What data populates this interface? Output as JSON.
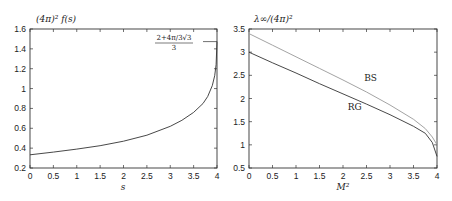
{
  "chart_data": [
    {
      "type": "line",
      "title": "",
      "ylabel": "(4π)² f(s)",
      "xlabel": "s",
      "xlim": [
        0,
        4
      ],
      "ylim": [
        0.2,
        1.6
      ],
      "xticks": [
        "0",
        "0.5",
        "1",
        "1.5",
        "2",
        "2.5",
        "3",
        "3.5",
        "4"
      ],
      "yticks": [
        "0.2",
        "0.4",
        "0.6",
        "0.8",
        "1",
        "1.2",
        "1.4",
        "1.6"
      ],
      "grid": false,
      "annotation": {
        "numerator": "2+4π/3√3",
        "denominator": "3",
        "y": 1.473
      },
      "series": [
        {
          "name": "f(s)",
          "x": [
            0,
            0.5,
            1,
            1.5,
            2,
            2.5,
            3,
            3.25,
            3.5,
            3.7,
            3.8,
            3.9,
            3.95,
            3.98,
            4.0
          ],
          "y": [
            0.333,
            0.36,
            0.39,
            0.425,
            0.47,
            0.53,
            0.62,
            0.68,
            0.76,
            0.85,
            0.92,
            1.03,
            1.13,
            1.24,
            1.473
          ]
        }
      ]
    },
    {
      "type": "line",
      "title": "",
      "ylabel": "λ∞/(4π)²",
      "xlabel": "M²",
      "xlim": [
        0,
        4
      ],
      "ylim": [
        0.5,
        3.5
      ],
      "xticks": [
        "0",
        "0.5",
        "1",
        "1.5",
        "2",
        "2.5",
        "3",
        "3.5",
        "4"
      ],
      "yticks": [
        "0.5",
        "1",
        "1.5",
        "2",
        "2.5",
        "3",
        "3.5"
      ],
      "grid": false,
      "series": [
        {
          "name": "BS",
          "label_pos": [
            2.45,
            2.38
          ],
          "x": [
            0,
            0.5,
            1,
            1.5,
            2,
            2.5,
            3,
            3.5,
            3.75,
            3.9,
            4.0
          ],
          "y": [
            3.4,
            3.15,
            2.9,
            2.65,
            2.4,
            2.14,
            1.86,
            1.55,
            1.35,
            1.17,
            1.0
          ]
        },
        {
          "name": "RG",
          "label_pos": [
            2.1,
            1.75
          ],
          "x": [
            0,
            0.5,
            1,
            1.5,
            2,
            2.5,
            3,
            3.5,
            3.75,
            3.9,
            4.0
          ],
          "y": [
            3.0,
            2.77,
            2.55,
            2.32,
            2.1,
            1.88,
            1.65,
            1.4,
            1.25,
            1.05,
            0.75
          ]
        }
      ]
    }
  ]
}
